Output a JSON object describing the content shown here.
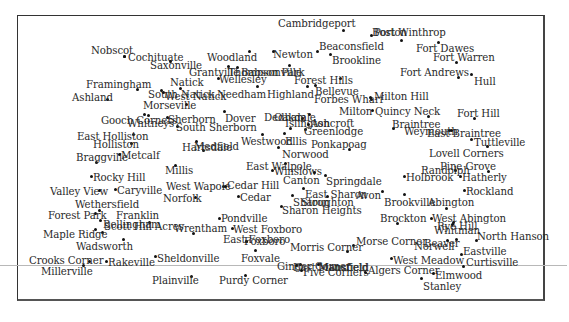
{
  "map": {
    "type": "town-location-map",
    "places": [
      {
        "name": "Cambridgeport",
        "lx": 278,
        "ly": 18,
        "dx": 343,
        "dy": 30
      },
      {
        "name": "Boston",
        "lx": 372,
        "ly": 27,
        "dx": 371,
        "dy": 35
      },
      {
        "name": "Port Winthrop",
        "lx": 374,
        "ly": 27,
        "dx": 401,
        "dy": 40
      },
      {
        "name": "Fort Dawes",
        "lx": 416,
        "ly": 43,
        "dx": 438,
        "dy": 42
      },
      {
        "name": "Fort Warren",
        "lx": 433,
        "ly": 52,
        "dx": 456,
        "dy": 62
      },
      {
        "name": "Fort Andrews",
        "lx": 400,
        "ly": 67,
        "dx": 458,
        "dy": 77
      },
      {
        "name": "Hull",
        "lx": 474,
        "ly": 76,
        "dx": 471,
        "dy": 74
      },
      {
        "name": "Nobscot",
        "lx": 91,
        "ly": 45,
        "dx": 124,
        "dy": 56
      },
      {
        "name": "Cochituate",
        "lx": 128,
        "ly": 52,
        "dx": 124,
        "dy": 56
      },
      {
        "name": "Saxonville",
        "lx": 150,
        "ly": 60,
        "dx": 170,
        "dy": 61
      },
      {
        "name": "Woodland",
        "lx": 207,
        "ly": 52,
        "dx": 249,
        "dy": 51
      },
      {
        "name": "Newton",
        "lx": 273,
        "ly": 49,
        "dx": 273,
        "dy": 51
      },
      {
        "name": "Beaconsfield",
        "lx": 319,
        "ly": 41,
        "dx": 317,
        "dy": 51
      },
      {
        "name": "Brookline",
        "lx": 332,
        "ly": 55,
        "dx": 330,
        "dy": 54
      },
      {
        "name": "Grantville",
        "lx": 189,
        "ly": 67,
        "dx": 228,
        "dy": 66
      },
      {
        "name": "Thompsonville",
        "lx": 228,
        "ly": 67,
        "dx": 237,
        "dy": 67
      },
      {
        "name": "Babson Park",
        "lx": 241,
        "ly": 67,
        "dx": 289,
        "dy": 65
      },
      {
        "name": "Wellesley",
        "lx": 219,
        "ly": 74,
        "dx": 218,
        "dy": 78
      },
      {
        "name": "Forest Hills",
        "lx": 294,
        "ly": 75,
        "dx": 340,
        "dy": 78
      },
      {
        "name": "Framingham",
        "lx": 86,
        "ly": 79,
        "dx": 137,
        "dy": 89
      },
      {
        "name": "Natick",
        "lx": 170,
        "ly": 77,
        "dx": 180,
        "dy": 88
      },
      {
        "name": "Ashland",
        "lx": 72,
        "ly": 92,
        "dx": 107,
        "dy": 99
      },
      {
        "name": "South Natick",
        "lx": 148,
        "ly": 89,
        "dx": 161,
        "dy": 90
      },
      {
        "name": "West Natick",
        "lx": 165,
        "ly": 91,
        "dx": 163,
        "dy": 92
      },
      {
        "name": "Needham",
        "lx": 217,
        "ly": 89,
        "dx": 257,
        "dy": 86
      },
      {
        "name": "Highland",
        "lx": 267,
        "ly": 89,
        "dx": 307,
        "dy": 86
      },
      {
        "name": "Bellevue",
        "lx": 315,
        "ly": 86,
        "dx": 315,
        "dy": 85
      },
      {
        "name": "Forbes Wharf",
        "lx": 314,
        "ly": 94,
        "dx": 371,
        "dy": 99
      },
      {
        "name": "Milton Hill",
        "lx": 374,
        "ly": 91,
        "dx": 370,
        "dy": 97
      },
      {
        "name": "Morseville",
        "lx": 143,
        "ly": 100,
        "dx": 186,
        "dy": 104
      },
      {
        "name": "Milton",
        "lx": 339,
        "ly": 106,
        "dx": 372,
        "dy": 110
      },
      {
        "name": "Quincy Neck",
        "lx": 375,
        "ly": 106,
        "dx": 428,
        "dy": 116
      },
      {
        "name": "Fort Hill",
        "lx": 457,
        "ly": 108,
        "dx": 474,
        "dy": 118
      },
      {
        "name": "Gooch Corners",
        "lx": 101,
        "ly": 115,
        "dx": 144,
        "dy": 114
      },
      {
        "name": "Whitneys",
        "lx": 127,
        "ly": 118,
        "dx": 148,
        "dy": 115
      },
      {
        "name": "Sherborn",
        "lx": 168,
        "ly": 114,
        "dx": 167,
        "dy": 117
      },
      {
        "name": "Dover",
        "lx": 225,
        "ly": 113,
        "dx": 224,
        "dy": 111
      },
      {
        "name": "Dedham",
        "lx": 264,
        "ly": 112,
        "dx": 302,
        "dy": 118
      },
      {
        "name": "Oakdale",
        "lx": 274,
        "ly": 112,
        "dx": 309,
        "dy": 114
      },
      {
        "name": "Islington",
        "lx": 285,
        "ly": 118,
        "dx": 290,
        "dy": 128
      },
      {
        "name": "Ashcroft",
        "lx": 311,
        "ly": 118,
        "dx": 308,
        "dy": 124
      },
      {
        "name": "Greenlodge",
        "lx": 304,
        "ly": 126,
        "dx": 305,
        "dy": 129
      },
      {
        "name": "Braintree",
        "lx": 392,
        "ly": 119,
        "dx": 393,
        "dy": 128
      },
      {
        "name": "Weymouth",
        "lx": 404,
        "ly": 126,
        "dx": 449,
        "dy": 130
      },
      {
        "name": "East Braintree",
        "lx": 427,
        "ly": 128,
        "dx": 451,
        "dy": 130
      },
      {
        "name": "Tuttleville",
        "lx": 474,
        "ly": 137,
        "dx": 471,
        "dy": 139
      },
      {
        "name": "East Holliston",
        "lx": 77,
        "ly": 131,
        "dx": 133,
        "dy": 134
      },
      {
        "name": "South Sherborn",
        "lx": 176,
        "ly": 122,
        "dx": 177,
        "dy": 126
      },
      {
        "name": "Holliston",
        "lx": 93,
        "ly": 139,
        "dx": 131,
        "dy": 143
      },
      {
        "name": "Westwood",
        "lx": 241,
        "ly": 136,
        "dx": 262,
        "dy": 134
      },
      {
        "name": "Ellis",
        "lx": 285,
        "ly": 136,
        "dx": 284,
        "dy": 133
      },
      {
        "name": "Ponkapoag",
        "lx": 311,
        "ly": 139,
        "dx": 349,
        "dy": 149
      },
      {
        "name": "Hartsdale",
        "lx": 182,
        "ly": 142,
        "dx": 203,
        "dy": 150
      },
      {
        "name": "Medfield",
        "lx": 194,
        "ly": 141,
        "dx": 196,
        "dy": 141
      },
      {
        "name": "Norwood",
        "lx": 282,
        "ly": 149,
        "dx": 278,
        "dy": 147
      },
      {
        "name": "Lovell Corners",
        "lx": 429,
        "ly": 148,
        "dx": 487,
        "dy": 146
      },
      {
        "name": "Braggville",
        "lx": 76,
        "ly": 152,
        "dx": 96,
        "dy": 162
      },
      {
        "name": "Metcalf",
        "lx": 121,
        "ly": 150,
        "dx": 119,
        "dy": 154
      },
      {
        "name": "East Walpole",
        "lx": 246,
        "ly": 161,
        "dx": 285,
        "dy": 163
      },
      {
        "name": "Pine Grove",
        "lx": 440,
        "ly": 161,
        "dx": 488,
        "dy": 171
      },
      {
        "name": "Millis",
        "lx": 165,
        "ly": 165,
        "dx": 175,
        "dy": 165
      },
      {
        "name": "Winslows",
        "lx": 274,
        "ly": 166,
        "dx": 272,
        "dy": 170
      },
      {
        "name": "Randolph",
        "lx": 421,
        "ly": 165,
        "dx": 455,
        "dy": 170
      },
      {
        "name": "Holbrook",
        "lx": 406,
        "ly": 172,
        "dx": 404,
        "dy": 176
      },
      {
        "name": "Hatherly",
        "lx": 462,
        "ly": 172,
        "dx": 460,
        "dy": 176
      },
      {
        "name": "Rocky Hill",
        "lx": 93,
        "ly": 172,
        "dx": 91,
        "dy": 176
      },
      {
        "name": "Canton",
        "lx": 283,
        "ly": 175,
        "dx": 314,
        "dy": 172
      },
      {
        "name": "Springdale",
        "lx": 326,
        "ly": 176,
        "dx": 325,
        "dy": 175
      },
      {
        "name": "Valley View",
        "lx": 50,
        "ly": 186,
        "dx": 99,
        "dy": 190
      },
      {
        "name": "Caryville",
        "lx": 117,
        "ly": 185,
        "dx": 115,
        "dy": 189
      },
      {
        "name": "West Wapole",
        "lx": 166,
        "ly": 181,
        "dx": 223,
        "dy": 186
      },
      {
        "name": "Cedar Hill",
        "lx": 227,
        "ly": 180,
        "dx": 225,
        "dy": 186
      },
      {
        "name": "Rockland",
        "lx": 466,
        "ly": 186,
        "dx": 464,
        "dy": 190
      },
      {
        "name": "East Sharon",
        "lx": 305,
        "ly": 189,
        "dx": 303,
        "dy": 188
      },
      {
        "name": "Avon",
        "lx": 356,
        "ly": 190,
        "dx": 382,
        "dy": 191
      },
      {
        "name": "Brookville",
        "lx": 384,
        "ly": 197,
        "dx": 404,
        "dy": 194
      },
      {
        "name": "Abington",
        "lx": 428,
        "ly": 197,
        "dx": 446,
        "dy": 208
      },
      {
        "name": "Norfolk",
        "lx": 163,
        "ly": 193,
        "dx": 195,
        "dy": 197
      },
      {
        "name": "Cedar",
        "lx": 240,
        "ly": 192,
        "dx": 238,
        "dy": 196
      },
      {
        "name": "Sharon",
        "lx": 293,
        "ly": 197,
        "dx": 292,
        "dy": 195
      },
      {
        "name": "Stoughton",
        "lx": 301,
        "ly": 197,
        "dx": 327,
        "dy": 196
      },
      {
        "name": "Wethersfield",
        "lx": 75,
        "ly": 199,
        "dx": 99,
        "dy": 210
      },
      {
        "name": "Sharon Heights",
        "lx": 282,
        "ly": 205,
        "dx": 281,
        "dy": 206
      },
      {
        "name": "Forest Park",
        "lx": 48,
        "ly": 210,
        "dx": 95,
        "dy": 213
      },
      {
        "name": "Franklin",
        "lx": 116,
        "ly": 210,
        "dx": 149,
        "dy": 222
      },
      {
        "name": "Brockton",
        "lx": 380,
        "ly": 213,
        "dx": 397,
        "dy": 223
      },
      {
        "name": "West Abington",
        "lx": 432,
        "ly": 213,
        "dx": 431,
        "dy": 218
      },
      {
        "name": "Pondville",
        "lx": 221,
        "ly": 213,
        "dx": 219,
        "dy": 218
      },
      {
        "name": "Bellingham",
        "lx": 103,
        "ly": 219,
        "dx": 100,
        "dy": 220
      },
      {
        "name": "Scott Hill Acres",
        "lx": 104,
        "ly": 221,
        "dx": 102,
        "dy": 232
      },
      {
        "name": "Wrentham",
        "lx": 174,
        "ly": 223,
        "dx": 193,
        "dy": 233
      },
      {
        "name": "West Foxboro",
        "lx": 233,
        "ly": 224,
        "dx": 232,
        "dy": 228
      },
      {
        "name": "Rye Hill",
        "lx": 437,
        "ly": 221,
        "dx": 453,
        "dy": 222
      },
      {
        "name": "Whitman",
        "lx": 434,
        "ly": 225,
        "dx": 452,
        "dy": 224
      },
      {
        "name": "North Hanson",
        "lx": 477,
        "ly": 231,
        "dx": 476,
        "dy": 240
      },
      {
        "name": "Maple Ridge",
        "lx": 43,
        "ly": 229,
        "dx": 95,
        "dy": 229
      },
      {
        "name": "East Foxboro",
        "lx": 223,
        "ly": 234,
        "dx": 246,
        "dy": 241
      },
      {
        "name": "Foxboro",
        "lx": 244,
        "ly": 236,
        "dx": 246,
        "dy": 241
      },
      {
        "name": "Morse Corner",
        "lx": 356,
        "ly": 236,
        "dx": 353,
        "dy": 245
      },
      {
        "name": "Norwell",
        "lx": 414,
        "ly": 241,
        "dx": 447,
        "dy": 240
      },
      {
        "name": "Beaver",
        "lx": 424,
        "ly": 238,
        "dx": 456,
        "dy": 239
      },
      {
        "name": "Morris Corner",
        "lx": 290,
        "ly": 242,
        "dx": 347,
        "dy": 251
      },
      {
        "name": "Wadsworth",
        "lx": 76,
        "ly": 241,
        "dx": 123,
        "dy": 239
      },
      {
        "name": "Eastville",
        "lx": 463,
        "ly": 246,
        "dx": 461,
        "dy": 254
      },
      {
        "name": "Crooks Corner",
        "lx": 29,
        "ly": 255,
        "dx": 89,
        "dy": 261
      },
      {
        "name": "Rakeville",
        "lx": 108,
        "ly": 257,
        "dx": 106,
        "dy": 261
      },
      {
        "name": "Sheldonville",
        "lx": 157,
        "ly": 253,
        "dx": 155,
        "dy": 256
      },
      {
        "name": "Foxvale",
        "lx": 241,
        "ly": 253,
        "dx": 255,
        "dy": 250
      },
      {
        "name": "West Meadow",
        "lx": 393,
        "ly": 255,
        "dx": 391,
        "dy": 258
      },
      {
        "name": "Curtisville",
        "lx": 466,
        "ly": 257,
        "dx": 463,
        "dy": 266
      },
      {
        "name": "Ginger Corner",
        "lx": 277,
        "ly": 261,
        "dx": 300,
        "dy": 264
      },
      {
        "name": "East Mansfield",
        "lx": 293,
        "ly": 262,
        "dx": 296,
        "dy": 265
      },
      {
        "name": "Mansfield",
        "lx": 318,
        "ly": 262,
        "dx": 318,
        "dy": 264
      },
      {
        "name": "Millerville",
        "lx": 41,
        "ly": 266,
        "dx": 83,
        "dy": 265
      },
      {
        "name": "Five Corners",
        "lx": 303,
        "ly": 267,
        "dx": 301,
        "dy": 270
      },
      {
        "name": "Algers Corner",
        "lx": 368,
        "ly": 265,
        "dx": 365,
        "dy": 272
      },
      {
        "name": "Elmwood",
        "lx": 435,
        "ly": 270,
        "dx": 433,
        "dy": 273
      },
      {
        "name": "Stanley",
        "lx": 423,
        "ly": 281,
        "dx": 421,
        "dy": 278
      },
      {
        "name": "Plainville",
        "lx": 152,
        "ly": 275,
        "dx": 191,
        "dy": 276
      },
      {
        "name": "Purdy Corner",
        "lx": 219,
        "ly": 275,
        "dx": 245,
        "dy": 275
      }
    ]
  }
}
